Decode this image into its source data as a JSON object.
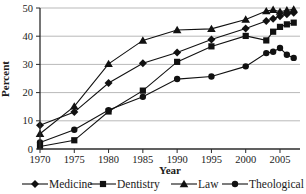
{
  "figure": {
    "kind": "statistical line chart",
    "description_visible_text_only": true
  },
  "chart_data": {
    "type": "line",
    "title": "",
    "xlabel": "Year",
    "ylabel": "Percent",
    "x_ticks": [
      1970,
      1975,
      1980,
      1985,
      1990,
      1995,
      2000,
      2005
    ],
    "y_ticks": [
      0,
      10,
      20,
      30,
      40,
      50
    ],
    "xlim": [
      1970,
      2008
    ],
    "ylim": [
      0,
      50
    ],
    "grid": "horizontal gridlines at 10,20,30,40,50",
    "legend_position": "bottom",
    "x": [
      1970,
      1975,
      1980,
      1985,
      1990,
      1995,
      2000,
      2003,
      2004,
      2005,
      2006,
      2007
    ],
    "series": [
      {
        "name": "Medicine",
        "marker": "diamond",
        "values": [
          8.4,
          13.1,
          23.4,
          30.4,
          34.2,
          38.8,
          42.7,
          45.4,
          46.2,
          47.1,
          47.8,
          48.3
        ]
      },
      {
        "name": "Dentistry",
        "marker": "square",
        "values": [
          0.9,
          3.1,
          13.3,
          20.7,
          30.9,
          36.4,
          40.1,
          38.5,
          41.6,
          43.3,
          44.2,
          44.8
        ]
      },
      {
        "name": "Law",
        "marker": "triangle",
        "values": [
          5.4,
          15.1,
          30.2,
          38.5,
          42.2,
          42.6,
          45.9,
          48.9,
          49.4,
          48.7,
          49.2,
          49.5
        ]
      },
      {
        "name": "Theological",
        "marker": "circle",
        "values": [
          2.3,
          6.8,
          13.8,
          18.5,
          24.8,
          25.7,
          29.3,
          34.0,
          34.5,
          35.8,
          33.4,
          32.3
        ]
      }
    ],
    "colors": {
      "series": "#111111",
      "grid": "#b9b9b9",
      "axis": "#2b2b2b",
      "background": "#ffffff"
    }
  }
}
